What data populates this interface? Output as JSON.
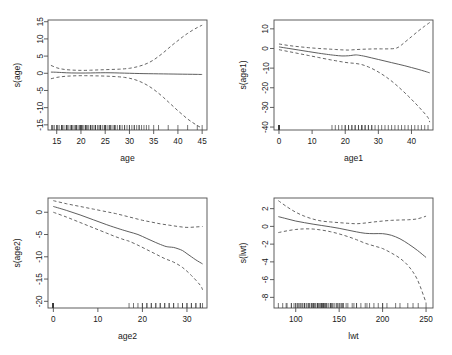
{
  "figure": {
    "title": "",
    "background_color": "#ffffff",
    "line_color": "#555555",
    "axis_color": "#4d4d4d"
  },
  "chart_data": [
    {
      "type": "line",
      "panel": "top-left",
      "title": "",
      "xlabel": "age",
      "ylabel": "s(age)",
      "xlim": [
        13.2,
        46.0
      ],
      "ylim": [
        -16.5,
        15.5
      ],
      "xticks": [
        15,
        20,
        25,
        30,
        35,
        40,
        45
      ],
      "yticks": [
        -15,
        -10,
        -5,
        0,
        5,
        10,
        15
      ],
      "xticklabels": [
        "15",
        "20",
        "25",
        "30",
        "35",
        "40",
        "45"
      ],
      "yticklabels": [
        "-15",
        "-10",
        "-5",
        "0",
        "5",
        "10",
        "15"
      ],
      "grid": false,
      "legend": "none",
      "series": [
        {
          "name": "fit",
          "style": "solid",
          "x": [
            13.8,
            15,
            16,
            17,
            18,
            19,
            20,
            21,
            22,
            23,
            24,
            25,
            26,
            27,
            28,
            29,
            30,
            31,
            32,
            33,
            34,
            35,
            36,
            37,
            38,
            39,
            40,
            41,
            42,
            43,
            44,
            45
          ],
          "y": [
            0.35,
            0.3,
            0.22,
            0.15,
            0.1,
            0.08,
            0.07,
            0.08,
            0.1,
            0.13,
            0.15,
            0.16,
            0.15,
            0.12,
            0.08,
            0.04,
            0.0,
            -0.04,
            -0.07,
            -0.1,
            -0.12,
            -0.14,
            -0.16,
            -0.18,
            -0.2,
            -0.22,
            -0.24,
            -0.26,
            -0.28,
            -0.3,
            -0.32,
            -0.35
          ]
        },
        {
          "name": "upper_ci",
          "style": "dashed",
          "x": [
            13.8,
            15,
            16,
            17,
            18,
            19,
            20,
            21,
            22,
            23,
            24,
            25,
            26,
            27,
            28,
            29,
            30,
            31,
            32,
            33,
            34,
            35,
            36,
            37,
            38,
            39,
            40,
            41,
            42,
            43,
            44,
            45
          ],
          "y": [
            2.3,
            1.6,
            1.25,
            1.05,
            0.95,
            0.88,
            0.85,
            0.85,
            0.9,
            0.95,
            1.0,
            1.05,
            1.1,
            1.15,
            1.2,
            1.3,
            1.45,
            1.7,
            2.05,
            2.5,
            3.1,
            3.9,
            4.9,
            6.0,
            7.2,
            8.4,
            9.5,
            10.6,
            11.6,
            12.5,
            13.3,
            14.0
          ]
        },
        {
          "name": "lower_ci",
          "style": "dashed",
          "x": [
            13.8,
            15,
            16,
            17,
            18,
            19,
            20,
            21,
            22,
            23,
            24,
            25,
            26,
            27,
            28,
            29,
            30,
            31,
            32,
            33,
            34,
            35,
            36,
            37,
            38,
            39,
            40,
            41,
            42,
            43,
            44,
            45
          ],
          "y": [
            -1.6,
            -1.2,
            -1.0,
            -0.85,
            -0.78,
            -0.72,
            -0.7,
            -0.7,
            -0.72,
            -0.75,
            -0.78,
            -0.82,
            -0.88,
            -0.95,
            -1.05,
            -1.2,
            -1.45,
            -1.8,
            -2.3,
            -2.95,
            -3.75,
            -4.7,
            -5.8,
            -7.0,
            -8.3,
            -9.6,
            -10.9,
            -12.1,
            -13.3,
            -14.3,
            -15.2,
            -16.0
          ]
        }
      ],
      "rug": {
        "position": "bottom",
        "values": [
          14,
          14,
          14.2,
          14.5,
          15,
          15,
          15.2,
          15.5,
          16,
          16,
          16,
          16.2,
          16.5,
          17,
          17,
          17,
          17.2,
          17.5,
          18,
          18,
          18,
          18,
          18.3,
          18.6,
          19,
          19,
          19,
          19,
          19.4,
          19.7,
          20,
          20,
          20,
          20,
          20,
          20.3,
          20.6,
          21,
          21,
          21,
          21,
          21.3,
          21.6,
          22,
          22,
          22,
          22,
          22.4,
          22.7,
          23,
          23,
          23,
          23,
          23.4,
          23.7,
          24,
          24,
          24,
          24,
          24.4,
          24.8,
          25,
          25,
          25,
          25,
          25.4,
          25.8,
          26,
          26,
          26,
          26.4,
          26.8,
          27,
          27,
          27,
          27.5,
          28,
          28,
          28,
          28.5,
          29,
          29,
          29.5,
          30,
          30,
          30.5,
          31,
          31,
          31.5,
          32,
          32,
          32.5,
          33,
          33.5,
          34,
          35,
          36,
          38,
          40,
          42,
          44,
          45
        ]
      }
    },
    {
      "type": "line",
      "panel": "top-right",
      "title": "",
      "xlabel": "age1",
      "ylabel": "s(age1)",
      "xlim": [
        -1.5,
        46.5
      ],
      "ylim": [
        -41.5,
        14.5
      ],
      "xticks": [
        0,
        10,
        20,
        30,
        40
      ],
      "yticks": [
        -40,
        -30,
        -20,
        -10,
        0,
        10
      ],
      "xticklabels": [
        "0",
        "10",
        "20",
        "30",
        "40"
      ],
      "yticklabels": [
        "-40",
        "-30",
        "-20",
        "-10",
        "0",
        "10"
      ],
      "grid": false,
      "legend": "none",
      "series": [
        {
          "name": "fit",
          "style": "solid",
          "x": [
            0,
            3,
            6,
            9,
            12,
            15,
            17,
            19,
            21,
            23,
            24,
            26,
            28,
            30,
            32,
            34,
            36,
            38,
            40,
            42,
            44,
            45.5
          ],
          "y": [
            0.8,
            0.0,
            -0.8,
            -1.6,
            -2.4,
            -3.1,
            -3.5,
            -3.8,
            -3.7,
            -3.3,
            -3.4,
            -4.0,
            -4.8,
            -5.6,
            -6.4,
            -7.2,
            -8.0,
            -8.8,
            -9.7,
            -10.6,
            -11.6,
            -12.4
          ]
        },
        {
          "name": "upper_ci",
          "style": "dashed",
          "x": [
            0,
            3,
            6,
            9,
            12,
            15,
            17,
            19,
            21,
            23,
            25,
            27,
            29,
            31,
            33,
            35,
            36,
            37,
            38,
            40,
            42,
            44,
            45.5
          ],
          "y": [
            2.3,
            1.5,
            0.9,
            0.4,
            0.0,
            -0.3,
            -0.5,
            -0.7,
            -0.8,
            -0.6,
            -0.4,
            -0.3,
            -0.2,
            -0.2,
            -0.2,
            0.0,
            0.6,
            1.8,
            3.2,
            6.0,
            8.8,
            11.4,
            13.2
          ]
        },
        {
          "name": "lower_ci",
          "style": "dashed",
          "x": [
            0,
            3,
            6,
            9,
            12,
            15,
            17,
            19,
            21,
            23,
            25,
            27,
            29,
            31,
            33,
            35,
            37,
            39,
            41,
            43,
            45,
            45.5
          ],
          "y": [
            -0.6,
            -1.6,
            -2.6,
            -3.6,
            -4.6,
            -5.6,
            -6.2,
            -6.8,
            -7.3,
            -7.6,
            -8.2,
            -9.4,
            -11.0,
            -13.0,
            -15.3,
            -18.0,
            -21.0,
            -24.2,
            -27.6,
            -31.2,
            -35.2,
            -37.5
          ]
        }
      ],
      "rug": {
        "position": "bottom",
        "values": [
          0,
          0,
          0,
          0,
          0,
          0,
          0,
          0,
          0,
          0,
          0,
          0,
          0,
          0,
          0,
          0,
          0,
          0,
          0,
          0,
          0,
          0,
          0,
          0,
          0,
          16,
          17,
          18,
          19,
          20,
          20,
          21,
          21,
          22,
          22,
          23,
          23,
          24,
          24,
          25,
          25,
          25,
          26,
          26,
          27,
          27,
          28,
          28,
          29,
          30,
          31,
          32,
          33,
          34,
          35,
          36,
          37,
          38,
          39,
          40,
          41,
          42,
          43,
          44,
          45
        ]
      }
    },
    {
      "type": "line",
      "panel": "bottom-left",
      "title": "",
      "xlabel": "age2",
      "ylabel": "s(age2)",
      "xlim": [
        -1.2,
        34.5
      ],
      "ylim": [
        -21.5,
        3.2
      ],
      "xticks": [
        0,
        10,
        20,
        30
      ],
      "yticks": [
        -20,
        -15,
        -10,
        -5,
        0
      ],
      "xticklabels": [
        "0",
        "10",
        "20",
        "30"
      ],
      "yticklabels": [
        "-20",
        "-15",
        "-10",
        "-5",
        "0"
      ],
      "grid": false,
      "legend": "none",
      "series": [
        {
          "name": "fit",
          "style": "solid",
          "x": [
            0,
            3,
            6,
            9,
            12,
            15,
            17,
            19,
            21,
            23,
            25,
            26,
            27,
            28,
            29,
            30,
            31,
            32,
            33.5
          ],
          "y": [
            1.3,
            0.4,
            -0.6,
            -1.7,
            -2.8,
            -3.8,
            -4.4,
            -5.0,
            -5.9,
            -6.8,
            -7.6,
            -7.8,
            -7.9,
            -8.2,
            -8.6,
            -9.3,
            -10.0,
            -10.7,
            -11.6
          ]
        },
        {
          "name": "upper_ci",
          "style": "dashed",
          "x": [
            0,
            3,
            6,
            9,
            12,
            14,
            16,
            18,
            20,
            22,
            24,
            26,
            28,
            30,
            32,
            33.5
          ],
          "y": [
            2.6,
            1.9,
            1.3,
            0.7,
            0.1,
            -0.3,
            -0.8,
            -1.3,
            -1.8,
            -2.2,
            -2.6,
            -2.9,
            -3.2,
            -3.4,
            -3.3,
            -3.2
          ]
        },
        {
          "name": "lower_ci",
          "style": "dashed",
          "x": [
            0,
            3,
            6,
            9,
            12,
            14,
            16,
            17,
            19,
            21,
            23,
            25,
            27,
            29,
            31,
            33,
            33.5
          ],
          "y": [
            0.0,
            -1.1,
            -2.3,
            -3.5,
            -4.7,
            -5.5,
            -6.2,
            -6.5,
            -7.4,
            -8.4,
            -9.4,
            -10.4,
            -11.2,
            -12.4,
            -14.2,
            -16.4,
            -17.4
          ]
        }
      ],
      "rug": {
        "position": "bottom",
        "values": [
          0,
          0,
          0,
          0,
          0,
          0,
          0,
          0,
          0,
          0,
          0,
          0,
          0,
          0,
          0,
          0,
          0,
          0,
          0,
          0,
          0,
          0,
          0,
          0,
          0,
          0,
          0,
          0,
          17,
          18,
          19,
          20,
          20,
          21,
          21,
          22,
          22,
          23,
          23,
          24,
          24,
          25,
          25,
          26,
          26,
          27,
          27,
          28,
          29,
          29,
          30,
          30,
          31,
          31,
          32,
          32,
          33,
          33,
          33.5
        ]
      }
    },
    {
      "type": "line",
      "panel": "bottom-right",
      "title": "",
      "xlabel": "lwt",
      "ylabel": "s(lwt)",
      "xlim": [
        75,
        258
      ],
      "ylim": [
        -9.2,
        3.2
      ],
      "xticks": [
        100,
        150,
        200,
        250
      ],
      "yticks": [
        -8,
        -6,
        -4,
        -2,
        0,
        2
      ],
      "xticklabels": [
        "100",
        "150",
        "200",
        "250"
      ],
      "yticklabels": [
        "-8",
        "-6",
        "-4",
        "-2",
        "0",
        "2"
      ],
      "grid": false,
      "legend": "none",
      "series": [
        {
          "name": "fit",
          "style": "solid",
          "x": [
            80,
            90,
            100,
            110,
            120,
            130,
            140,
            150,
            160,
            170,
            180,
            190,
            200,
            210,
            220,
            230,
            240,
            250
          ],
          "y": [
            1.1,
            0.85,
            0.6,
            0.42,
            0.25,
            0.1,
            -0.05,
            -0.22,
            -0.42,
            -0.62,
            -0.78,
            -0.82,
            -0.82,
            -1.0,
            -1.4,
            -2.0,
            -2.7,
            -3.5
          ]
        },
        {
          "name": "upper_ci",
          "style": "dashed",
          "x": [
            80,
            90,
            100,
            110,
            120,
            130,
            140,
            150,
            160,
            170,
            180,
            190,
            200,
            210,
            220,
            230,
            240,
            250
          ],
          "y": [
            2.9,
            2.2,
            1.6,
            1.15,
            0.82,
            0.6,
            0.5,
            0.42,
            0.35,
            0.3,
            0.38,
            0.5,
            0.6,
            0.68,
            0.72,
            0.75,
            0.85,
            1.15
          ]
        },
        {
          "name": "lower_ci",
          "style": "dashed",
          "x": [
            80,
            90,
            100,
            110,
            120,
            130,
            140,
            150,
            160,
            170,
            180,
            190,
            200,
            210,
            220,
            230,
            240,
            250
          ],
          "y": [
            -0.7,
            -0.5,
            -0.35,
            -0.28,
            -0.3,
            -0.42,
            -0.6,
            -0.85,
            -1.15,
            -1.5,
            -1.9,
            -2.2,
            -2.5,
            -3.0,
            -3.6,
            -4.5,
            -6.0,
            -8.6
          ]
        }
      ],
      "rug": {
        "position": "bottom",
        "values": [
          80,
          85,
          89,
          90,
          95,
          95,
          98,
          100,
          100,
          102,
          103,
          105,
          105,
          107,
          108,
          110,
          110,
          110,
          112,
          113,
          115,
          115,
          116,
          118,
          118,
          120,
          120,
          120,
          121,
          122,
          123,
          125,
          125,
          125,
          126,
          127,
          128,
          129,
          130,
          130,
          130,
          131,
          132,
          132,
          133,
          134,
          135,
          135,
          136,
          138,
          140,
          140,
          141,
          142,
          143,
          145,
          147,
          148,
          150,
          150,
          152,
          153,
          154,
          155,
          158,
          160,
          165,
          167,
          170,
          170,
          175,
          180,
          182,
          185,
          190,
          195,
          200,
          200,
          205,
          215,
          220,
          229,
          235,
          241,
          250
        ]
      }
    }
  ]
}
